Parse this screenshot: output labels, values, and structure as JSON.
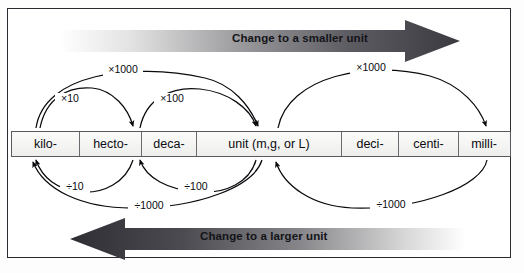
{
  "diagram": {
    "frame_color": "#2a2a30",
    "banners": [
      {
        "name": "smaller-unit-banner",
        "label": "Change to a smaller unit",
        "direction": "right",
        "gradient_from": "#ffffff",
        "gradient_to": "#3a3a40"
      },
      {
        "name": "larger-unit-banner",
        "label": "Change to a larger unit",
        "direction": "left",
        "gradient_from": "#2e2e34",
        "gradient_to": "#ffffff"
      }
    ],
    "scale": {
      "cells": [
        {
          "label": "kilo-"
        },
        {
          "label": "hecto-"
        },
        {
          "label": "deca-"
        },
        {
          "label": "unit (m,g, or L)"
        },
        {
          "label": "deci-"
        },
        {
          "label": "centi-"
        },
        {
          "label": "milli-"
        }
      ]
    },
    "arcs": {
      "above": [
        {
          "name": "arc-kilo-to-unit-x1000",
          "label": "×1000",
          "from": "kilo-",
          "to": "unit (m,g, or L)",
          "factor": 1000,
          "operation": "multiply"
        },
        {
          "name": "arc-kilo-to-hecto-x10",
          "label": "×10",
          "from": "kilo-",
          "to": "hecto-",
          "factor": 10,
          "operation": "multiply"
        },
        {
          "name": "arc-deca-to-unit-x100",
          "label": "×100",
          "from": "deca-",
          "to": "unit (m,g, or L)",
          "factor": 100,
          "operation": "multiply"
        },
        {
          "name": "arc-unit-to-milli-x1000",
          "label": "×1000",
          "from": "unit (m,g, or L)",
          "to": "milli-",
          "factor": 1000,
          "operation": "multiply"
        }
      ],
      "below": [
        {
          "name": "arc-hecto-to-kilo-div10",
          "label": "÷10",
          "from": "hecto-",
          "to": "kilo-",
          "factor": 10,
          "operation": "divide"
        },
        {
          "name": "arc-unit-to-deca-div100",
          "label": "÷100",
          "from": "unit (m,g, or L)",
          "to": "deca-",
          "factor": 100,
          "operation": "divide"
        },
        {
          "name": "arc-unit-to-kilo-div1000",
          "label": "÷1000",
          "from": "unit (m,g, or L)",
          "to": "kilo-",
          "factor": 1000,
          "operation": "divide"
        },
        {
          "name": "arc-milli-to-unit-div1000",
          "label": "÷1000",
          "from": "milli-",
          "to": "unit (m,g, or L)",
          "factor": 1000,
          "operation": "divide"
        }
      ]
    }
  }
}
